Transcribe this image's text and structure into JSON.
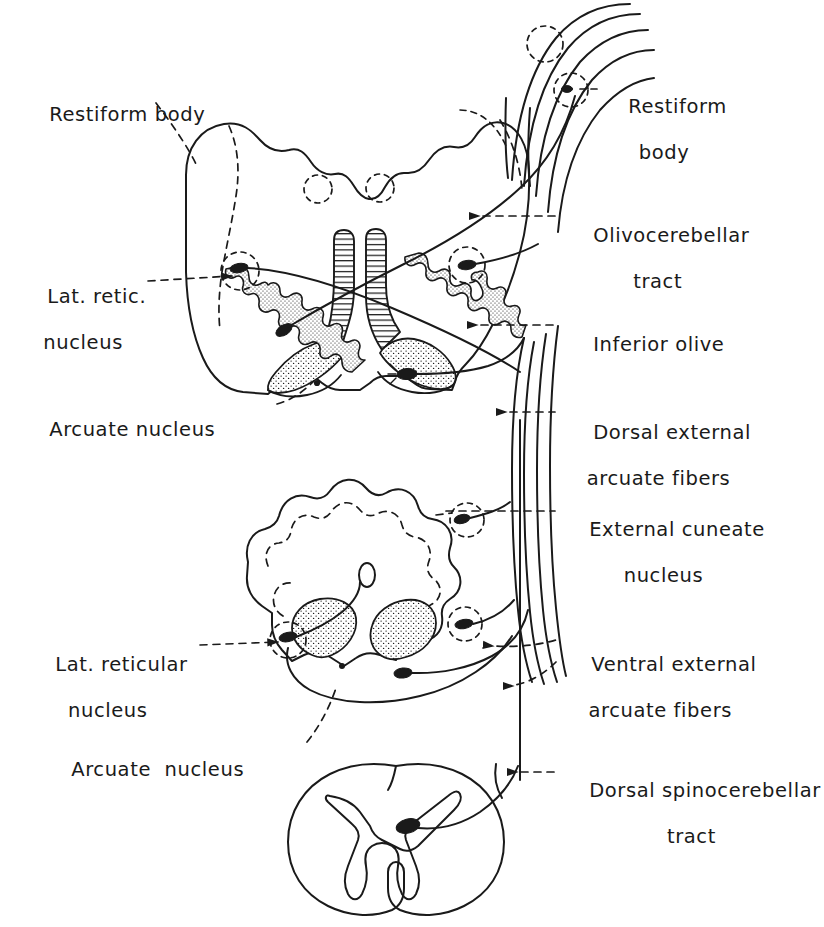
{
  "figure": {
    "ink_color": "#1a1a1a",
    "background_color": "#ffffff"
  },
  "labels": {
    "restiform_body_left": {
      "line1": "Restiform body",
      "line2": ""
    },
    "restiform_body_right": {
      "line1": "Restiform",
      "line2": "body"
    },
    "olivocerebellar_tract": {
      "line1": "Olivocerebellar",
      "line2": "tract"
    },
    "lat_retic_nucleus": {
      "line1": "Lat. retic.",
      "line2": "nucleus"
    },
    "inferior_olive": {
      "line1": "Inferior olive",
      "line2": ""
    },
    "arcuate_nucleus_upper": {
      "line1": "Arcuate nucleus",
      "line2": ""
    },
    "dorsal_external_arcuate_fibers": {
      "line1": "Dorsal external",
      "line2": "arcuate fibers"
    },
    "external_cuneate_nucleus": {
      "line1": "External cuneate",
      "line2": "nucleus"
    },
    "lat_reticular_nucleus": {
      "line1": "Lat. reticular",
      "line2": "nucleus"
    },
    "ventral_external_arcuate_fibers": {
      "line1": "Ventral external",
      "line2": "arcuate fibers"
    },
    "arcuate_nucleus_lower": {
      "line1": "Arcuate  nucleus",
      "line2": ""
    },
    "dorsal_spinocerebellar_tract": {
      "line1": "Dorsal spinocerebellar",
      "line2": "tract"
    }
  },
  "sections": {
    "upper_medulla": {
      "name": "Upper medulla cross-section",
      "central_canal_marker": ""
    },
    "lower_medulla": {
      "name": "Lower medulla cross-section",
      "central_canal_marker": "0"
    },
    "spinal_cord": {
      "name": "Spinal cord cross-section",
      "central_canal_marker": ""
    }
  },
  "structures": {
    "inferior_olive_left": "inferior-olive-left",
    "inferior_olive_right": "inferior-olive-right",
    "pyramid_left": "pyramid-left",
    "pyramid_right": "pyramid-right",
    "arcuate_nucleus_left": "arcuate-nucleus-left",
    "arcuate_nucleus_right": "arcuate-nucleus-right",
    "restiform_body_fibers": "restiform-body-fiber-bundle",
    "descending_fiber_bundle": "descending-fiber-bundle",
    "gray_matter_butterfly": "spinal-gray-matter"
  }
}
